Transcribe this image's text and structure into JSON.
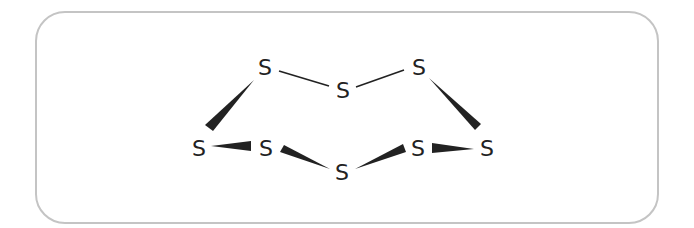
{
  "diagram": {
    "type": "molecular-structure",
    "molecule": "S8 (cyclooctasulfur, crown conformation)",
    "atoms": [
      {
        "id": "s1",
        "label": "S",
        "x": 265,
        "y": 67
      },
      {
        "id": "s2",
        "label": "S",
        "x": 343,
        "y": 90
      },
      {
        "id": "s3",
        "label": "S",
        "x": 419,
        "y": 67
      },
      {
        "id": "s4",
        "label": "S",
        "x": 199,
        "y": 148
      },
      {
        "id": "s5",
        "label": "S",
        "x": 266,
        "y": 148
      },
      {
        "id": "s6",
        "label": "S",
        "x": 342,
        "y": 172
      },
      {
        "id": "s7",
        "label": "S",
        "x": 418,
        "y": 148
      },
      {
        "id": "s8",
        "label": "S",
        "x": 487,
        "y": 148
      }
    ],
    "bonds": [
      {
        "from": "s1",
        "to": "s2",
        "style": "plain"
      },
      {
        "from": "s2",
        "to": "s3",
        "style": "plain"
      },
      {
        "from": "s1",
        "to": "s4",
        "style": "wedge"
      },
      {
        "from": "s4",
        "to": "s5",
        "style": "wedge"
      },
      {
        "from": "s5",
        "to": "s6",
        "style": "wedge"
      },
      {
        "from": "s6",
        "to": "s7",
        "style": "wedge"
      },
      {
        "from": "s7",
        "to": "s8",
        "style": "wedge"
      },
      {
        "from": "s3",
        "to": "s8",
        "style": "wedge"
      }
    ],
    "colors": {
      "border": "#c4c4c4",
      "ink": "#222222"
    }
  }
}
